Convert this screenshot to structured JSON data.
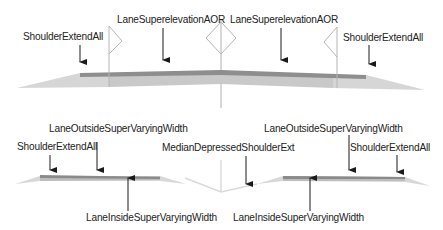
{
  "colors": {
    "background": "#ffffff",
    "lane_top": "#8c8c8c",
    "lane_body": "#c8c8c8",
    "shoulder": "#d4d4d4",
    "flag_stroke": "#b0b0b0",
    "arrow": "#1a1a1a",
    "text": "#222222"
  },
  "top_section": {
    "labels": {
      "left_shoulder": "ShoulderExtendAll",
      "left_lane": "LaneSuperelevationAOR",
      "right_lane": "LaneSuperelevationAOR",
      "right_shoulder": "ShoulderExtendAll"
    }
  },
  "bottom_section": {
    "labels": {
      "left_outside_lane": "LaneOutsideSuperVaryingWidth",
      "left_shoulder": "ShoulderExtendAll",
      "left_inside_lane": "LaneInsideSuperVaryingWidth",
      "median": "MedianDepressedShoulderExt",
      "right_outside_lane": "LaneOutsideSuperVaryingWidth",
      "right_shoulder": "ShoulderExtendAll",
      "right_inside_lane": "LaneInsideSuperVaryingWidth"
    }
  }
}
